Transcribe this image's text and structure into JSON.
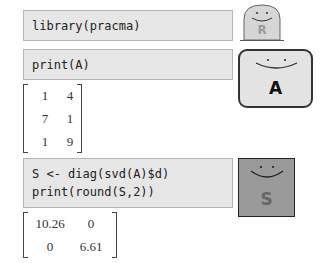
{
  "blocks": [
    {
      "code": "library(pracma)",
      "character": {
        "letter": "R",
        "shape": "blob",
        "fill": "#d6d6d6"
      }
    },
    {
      "code": "print(A)",
      "character": {
        "letter": "A",
        "shape": "rounded-box",
        "fill": "#e3e3e3"
      },
      "output": {
        "matrix": [
          [
            "1",
            "4"
          ],
          [
            "7",
            "1"
          ],
          [
            "1",
            "9"
          ]
        ]
      }
    },
    {
      "code": "S <- diag(svd(A)$d)\nprint(round(S,2))",
      "character": {
        "letter": "S",
        "shape": "square",
        "fill": "#9a9a9a"
      },
      "output": {
        "matrix": [
          [
            "10.26",
            "0"
          ],
          [
            "0",
            "6.61"
          ]
        ]
      }
    }
  ]
}
